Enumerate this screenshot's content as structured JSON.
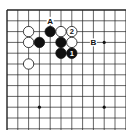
{
  "diagram": {
    "type": "go-board-fragment",
    "board_size": 19,
    "visible_cols": 11,
    "visible_rows": 11,
    "edges": {
      "top": true,
      "left": true,
      "right": false,
      "bottom": false
    },
    "star_points": [
      [
        9,
        3
      ],
      [
        3,
        9
      ],
      [
        9,
        9
      ]
    ],
    "stones": [
      {
        "color": "white",
        "col": 2,
        "row": 2,
        "label": ""
      },
      {
        "color": "white",
        "col": 2,
        "row": 3,
        "label": ""
      },
      {
        "color": "black",
        "col": 3,
        "row": 3,
        "label": ""
      },
      {
        "color": "black",
        "col": 4,
        "row": 2,
        "label": ""
      },
      {
        "color": "white",
        "col": 5,
        "row": 2,
        "label": ""
      },
      {
        "color": "white",
        "col": 6,
        "row": 2,
        "label": "2"
      },
      {
        "color": "black",
        "col": 5,
        "row": 3,
        "label": ""
      },
      {
        "color": "white",
        "col": 6,
        "row": 3,
        "label": ""
      },
      {
        "color": "black",
        "col": 5,
        "row": 4,
        "label": ""
      },
      {
        "color": "black",
        "col": 6,
        "row": 4,
        "label": "1"
      },
      {
        "color": "white",
        "col": 2,
        "row": 5,
        "label": ""
      }
    ],
    "markers": [
      {
        "label": "A",
        "col": 4,
        "row": 1
      },
      {
        "label": "B",
        "col": 8,
        "row": 3
      }
    ]
  }
}
